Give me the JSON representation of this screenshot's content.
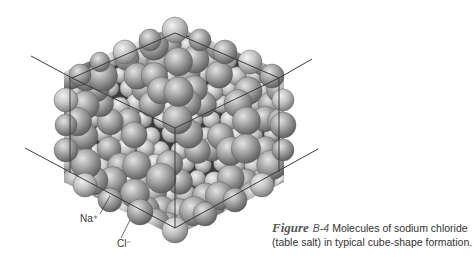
{
  "figure": {
    "word": "Figure",
    "number": "B-4",
    "caption_line1": "Molecules of sodium chloride",
    "caption_line2": "(table salt) in typical cube-shape formation."
  },
  "labels": {
    "sodium": "Na⁺",
    "chloride": "Cl⁻"
  },
  "colors": {
    "sphere_light": "#c9c9c9",
    "sphere_dark": "#6e6e6e",
    "line": "#444444"
  }
}
